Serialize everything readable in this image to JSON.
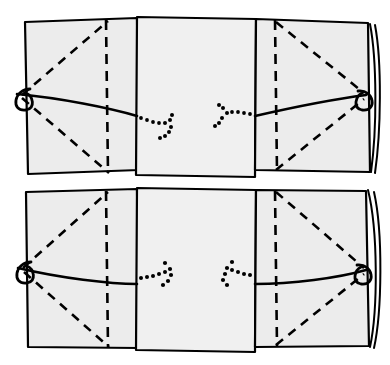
{
  "figure": {
    "title": "Origami folding instruction diagram",
    "style": {
      "background_color": "#ffffff",
      "paper_fill": "#ececec",
      "paper_fill_center": "#f0f0f0",
      "ink_color": "#000000"
    },
    "steps": [
      {
        "id": "step-top",
        "label": "upper diagram",
        "panels": [
          {
            "id": "panel-left",
            "label": "left flap"
          },
          {
            "id": "panel-center",
            "label": "center panel"
          },
          {
            "id": "panel-right",
            "label": "right flap"
          }
        ],
        "creases": [
          {
            "id": "crease-vertical-left",
            "type": "dashed",
            "orientation": "vertical"
          },
          {
            "id": "crease-vertical-right",
            "type": "dashed",
            "orientation": "vertical"
          },
          {
            "id": "crease-diagonal-left-upper",
            "type": "dashed",
            "orientation": "diagonal"
          },
          {
            "id": "crease-diagonal-left-lower",
            "type": "dashed",
            "orientation": "diagonal"
          },
          {
            "id": "crease-diagonal-right-upper",
            "type": "dashed",
            "orientation": "diagonal"
          },
          {
            "id": "crease-diagonal-right-lower",
            "type": "dashed",
            "orientation": "diagonal"
          }
        ],
        "arrows": [
          {
            "id": "arrow-left-inward",
            "direction": "right",
            "style": "dotted-curved"
          },
          {
            "id": "arrow-right-inward",
            "direction": "left",
            "style": "dotted-curved"
          }
        ],
        "loops": [
          {
            "id": "loop-left-edge",
            "side": "left"
          },
          {
            "id": "loop-right-edge",
            "side": "right"
          }
        ],
        "horizontal_crease": {
          "id": "crease-horizontal",
          "type": "solid-curved",
          "sag": "upward-arc"
        }
      },
      {
        "id": "step-bottom",
        "label": "lower diagram",
        "panels": [
          {
            "id": "panel-left",
            "label": "left flap"
          },
          {
            "id": "panel-center",
            "label": "center panel"
          },
          {
            "id": "panel-right",
            "label": "right flap"
          }
        ],
        "creases": [
          {
            "id": "crease-vertical-left",
            "type": "dashed",
            "orientation": "vertical"
          },
          {
            "id": "crease-vertical-right",
            "type": "dashed",
            "orientation": "vertical"
          },
          {
            "id": "crease-diagonal-left-upper",
            "type": "dashed",
            "orientation": "diagonal"
          },
          {
            "id": "crease-diagonal-left-lower",
            "type": "dashed",
            "orientation": "diagonal"
          },
          {
            "id": "crease-diagonal-right-upper",
            "type": "dashed",
            "orientation": "diagonal"
          },
          {
            "id": "crease-diagonal-right-lower",
            "type": "dashed",
            "orientation": "diagonal"
          }
        ],
        "arrows": [
          {
            "id": "arrow-left-inward",
            "direction": "right",
            "style": "dotted-curved"
          },
          {
            "id": "arrow-right-inward",
            "direction": "left",
            "style": "dotted-curved"
          }
        ],
        "loops": [
          {
            "id": "loop-left-edge",
            "side": "left"
          },
          {
            "id": "loop-right-edge",
            "side": "right"
          }
        ],
        "horizontal_crease": {
          "id": "crease-horizontal",
          "type": "solid-curved",
          "sag": "downward-arc"
        }
      }
    ]
  }
}
